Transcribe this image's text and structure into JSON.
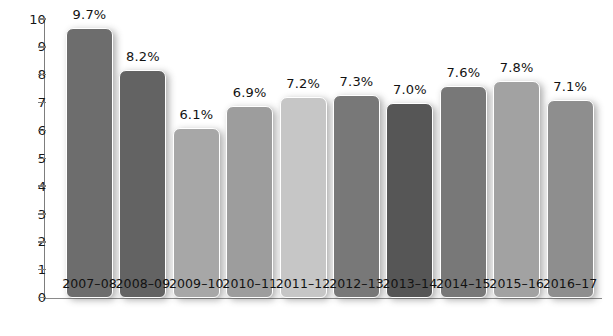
{
  "chart_data": {
    "type": "bar",
    "title": "",
    "subtitle": "",
    "xlabel": "",
    "ylabel": "",
    "ylim": [
      0,
      10
    ],
    "ytick_labels": [
      "10",
      "9",
      "8",
      "7",
      "6",
      "5",
      "4",
      "3",
      "2",
      "1",
      "0"
    ],
    "ytick_values": [
      10,
      9,
      8,
      7,
      6,
      5,
      4,
      3,
      2,
      1,
      0
    ],
    "grid": false,
    "legend": null,
    "categories": [
      "2007–08",
      "2008–09",
      "2009–10",
      "2010–11",
      "2011–12",
      "2012–13",
      "2013–14",
      "2014–15",
      "2015–16",
      "2016–17"
    ],
    "values": [
      9.7,
      8.2,
      6.1,
      6.9,
      7.2,
      7.3,
      7.0,
      7.6,
      7.8,
      7.1
    ],
    "data_labels": [
      "9.7%",
      "8.2%",
      "6.1%",
      "6.9%",
      "7.2%",
      "7.3%",
      "7.0%",
      "7.6%",
      "7.8%",
      "7.1%"
    ],
    "bar_colors": [
      "#6d6d6d",
      "#636363",
      "#a7a7a7",
      "#9d9d9d",
      "#c6c6c6",
      "#787878",
      "#565656",
      "#787878",
      "#a2a2a2",
      "#8e8e8e"
    ],
    "axis_color": "#7d7d7d",
    "background_color": "#ffffff",
    "bar_outline_color": "#ffffff"
  }
}
